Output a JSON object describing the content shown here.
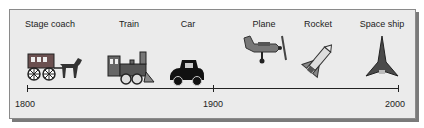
{
  "timeline": {
    "items": [
      {
        "label": "Stage coach",
        "icon": "stagecoach-icon"
      },
      {
        "label": "Train",
        "icon": "steam-train-icon"
      },
      {
        "label": "Car",
        "icon": "car-icon"
      },
      {
        "label": "Plane",
        "icon": "plane-icon"
      },
      {
        "label": "Rocket",
        "icon": "rocket-icon"
      },
      {
        "label": "Space ship",
        "icon": "spaceship-icon"
      }
    ],
    "axis": {
      "ticks": [
        "1800",
        "1900",
        "2000"
      ]
    }
  }
}
